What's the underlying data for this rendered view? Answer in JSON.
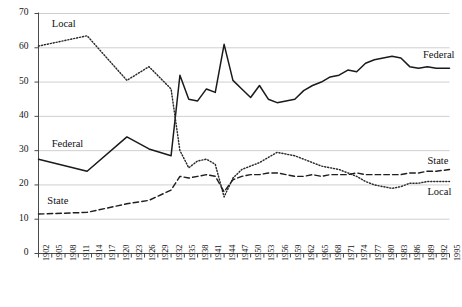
{
  "chart_data": {
    "type": "line",
    "title": "",
    "subtitle": "",
    "xlabel": "",
    "ylabel": "",
    "xlim": [
      1902,
      1995
    ],
    "ylim": [
      0,
      70
    ],
    "grid": true,
    "grid_axis": "y",
    "legend_position": "inline-annotations",
    "yticks": [
      0,
      10,
      20,
      30,
      40,
      50,
      60,
      70
    ],
    "ytick_labels": [
      "0",
      "10",
      "20",
      "30",
      "40",
      "50",
      "60",
      "70"
    ],
    "xticks": [
      1902,
      1905,
      1908,
      1911,
      1914,
      1917,
      1920,
      1923,
      1926,
      1929,
      1932,
      1935,
      1938,
      1941,
      1944,
      1947,
      1950,
      1953,
      1956,
      1959,
      1962,
      1965,
      1968,
      1971,
      1974,
      1977,
      1980,
      1983,
      1986,
      1989,
      1992,
      1995
    ],
    "xtick_labels": [
      "1902",
      "1905",
      "1908",
      "1911",
      "1914",
      "1917",
      "1920",
      "1923",
      "1926",
      "1929",
      "1932",
      "1935",
      "1938",
      "1941",
      "1944",
      "1947",
      "1950",
      "1953",
      "1956",
      "1959",
      "1962",
      "1965",
      "1968",
      "1971",
      "1974",
      "1977",
      "1980",
      "1983",
      "1986",
      "1989",
      "1992",
      "1995"
    ],
    "annotations": [
      {
        "text": "Local",
        "series": "Local",
        "position": "top-left",
        "x": 1905,
        "y": 66.5
      },
      {
        "text": "Federal",
        "series": "Federal",
        "position": "mid-left",
        "x": 1905,
        "y": 31.5
      },
      {
        "text": "State",
        "series": "State",
        "position": "lower-left",
        "x": 1904,
        "y": 15.0
      },
      {
        "text": "Federal",
        "series": "Federal",
        "position": "top-right",
        "x": 1989,
        "y": 57.5
      },
      {
        "text": "State",
        "series": "State",
        "position": "lower-right",
        "x": 1990,
        "y": 26.5
      },
      {
        "text": "Local",
        "series": "Local",
        "position": "lower-right",
        "x": 1990,
        "y": 17.5
      }
    ],
    "x": [
      1902,
      1905,
      1908,
      1911,
      1914,
      1917,
      1920,
      1923,
      1926,
      1929,
      1932,
      1935,
      1938,
      1941,
      1944,
      1947,
      1950,
      1953,
      1956,
      1959,
      1962,
      1965,
      1968,
      1971,
      1974,
      1977,
      1980,
      1983,
      1986,
      1989,
      1992,
      1995
    ],
    "series": [
      {
        "name": "Federal",
        "style": "solid",
        "color": "#1a1a1a",
        "x": [
          1902,
          1913,
          1922,
          1927,
          1932,
          1934,
          1936,
          1938,
          1940,
          1942,
          1944,
          1946,
          1948,
          1950,
          1952,
          1954,
          1956,
          1958,
          1960,
          1962,
          1964,
          1966,
          1968,
          1970,
          1972,
          1974,
          1976,
          1978,
          1980,
          1982,
          1984,
          1986,
          1988,
          1990,
          1992,
          1995
        ],
        "values": [
          27.5,
          24.0,
          34.0,
          30.5,
          28.5,
          52.0,
          45.0,
          44.5,
          48.0,
          47.0,
          61.0,
          50.5,
          48.0,
          45.5,
          49.0,
          45.0,
          44.0,
          44.5,
          45.0,
          47.5,
          49.0,
          50.0,
          51.5,
          52.0,
          53.5,
          53.0,
          55.5,
          56.5,
          57.0,
          57.5,
          57.0,
          54.5,
          54.0,
          54.5,
          54.0,
          54.0
        ]
      },
      {
        "name": "Local",
        "style": "dotted",
        "color": "#2a2a2a",
        "x": [
          1902,
          1913,
          1922,
          1927,
          1932,
          1934,
          1936,
          1938,
          1940,
          1942,
          1944,
          1946,
          1948,
          1950,
          1952,
          1954,
          1956,
          1958,
          1960,
          1962,
          1964,
          1966,
          1968,
          1970,
          1972,
          1974,
          1976,
          1978,
          1980,
          1982,
          1984,
          1986,
          1988,
          1990,
          1992,
          1995
        ],
        "values": [
          60.5,
          63.5,
          50.5,
          54.5,
          48.0,
          30.0,
          25.0,
          27.0,
          27.5,
          26.0,
          16.5,
          22.0,
          24.5,
          25.5,
          26.5,
          28.0,
          29.5,
          29.0,
          28.5,
          27.5,
          26.5,
          25.5,
          25.0,
          24.5,
          23.5,
          22.5,
          21.0,
          20.0,
          19.5,
          19.0,
          19.5,
          20.5,
          20.5,
          21.0,
          21.0,
          21.0
        ]
      },
      {
        "name": "State",
        "style": "dashed",
        "color": "#1f1f1f",
        "x": [
          1902,
          1913,
          1922,
          1927,
          1932,
          1934,
          1936,
          1938,
          1940,
          1942,
          1944,
          1946,
          1948,
          1950,
          1952,
          1954,
          1956,
          1958,
          1960,
          1962,
          1964,
          1966,
          1968,
          1970,
          1972,
          1974,
          1976,
          1978,
          1980,
          1982,
          1984,
          1986,
          1988,
          1990,
          1992,
          1995
        ],
        "values": [
          11.5,
          12.0,
          14.5,
          15.5,
          18.5,
          22.5,
          22.0,
          22.5,
          23.0,
          22.5,
          18.0,
          21.5,
          22.5,
          23.0,
          23.0,
          23.5,
          23.5,
          23.0,
          22.5,
          22.5,
          23.0,
          22.5,
          23.0,
          23.0,
          23.0,
          23.5,
          23.0,
          23.0,
          23.0,
          23.0,
          23.0,
          23.5,
          23.5,
          24.0,
          24.0,
          24.5
        ]
      }
    ]
  }
}
